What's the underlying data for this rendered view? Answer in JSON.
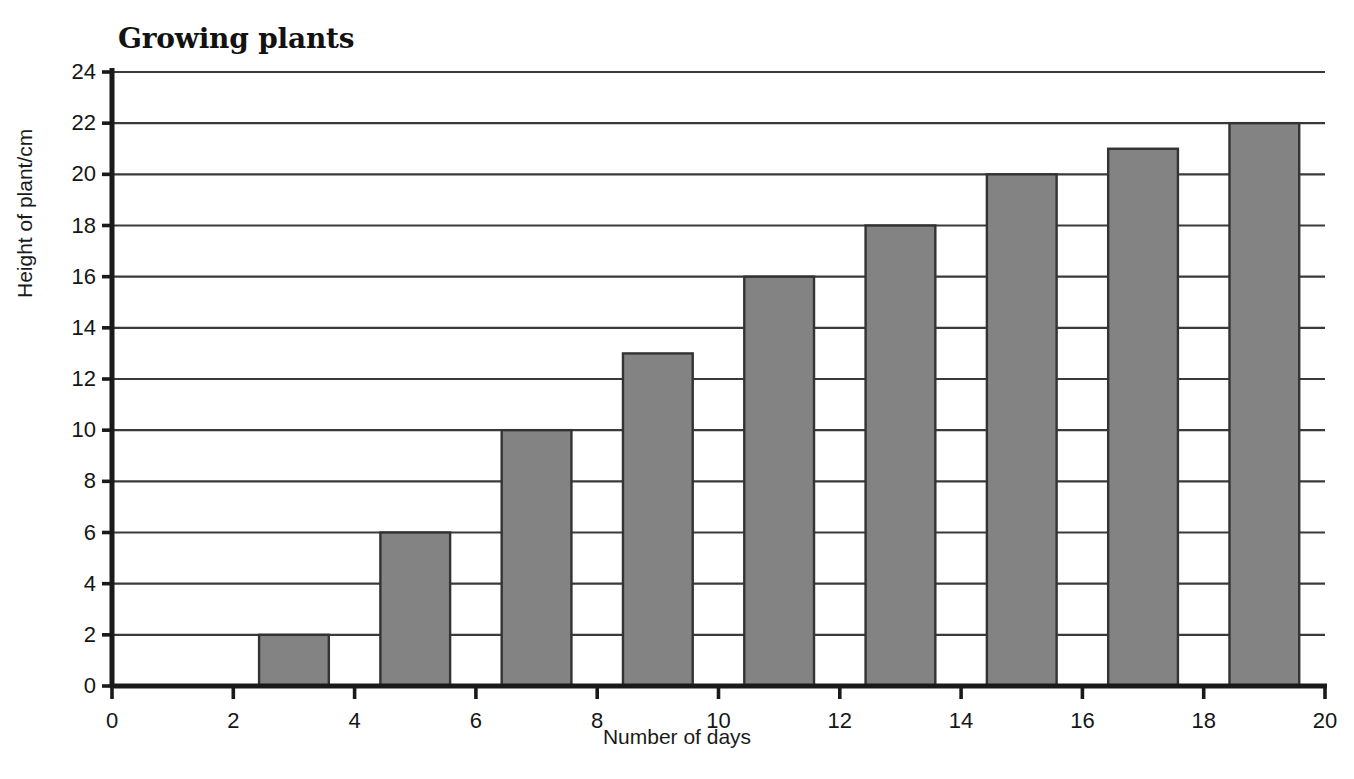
{
  "chart_data": {
    "type": "bar",
    "title": "Growing plants",
    "xlabel": "Number of days",
    "ylabel": "Height of plant/cm",
    "categories": [
      4,
      6,
      8,
      10,
      12,
      14,
      16,
      18,
      20
    ],
    "values": [
      2,
      6,
      10,
      13,
      16,
      18,
      20,
      21,
      22
    ],
    "x": [
      4,
      6,
      8,
      10,
      12,
      14,
      16,
      18,
      20
    ],
    "xlim": [
      0,
      20
    ],
    "ylim": [
      0,
      24
    ],
    "x_ticks": [
      0,
      2,
      4,
      6,
      8,
      10,
      12,
      14,
      16,
      18,
      20
    ],
    "y_ticks": [
      0,
      2,
      4,
      6,
      8,
      10,
      12,
      14,
      16,
      18,
      20,
      22,
      24
    ],
    "x_tick_labels": [
      "0",
      "2",
      "4",
      "6",
      "8",
      "10",
      "12",
      "14",
      "16",
      "18",
      "20"
    ],
    "y_tick_labels": [
      "0",
      "2",
      "4",
      "6",
      "8",
      "10",
      "12",
      "14",
      "16",
      "18",
      "20",
      "22",
      "24"
    ],
    "grid": "horizontal",
    "legend": "none",
    "bar_fill_color": "#838383",
    "bar_edge_color": "#333333",
    "axis_color": "#1a1a1a",
    "grid_color": "#3a3a3a",
    "background_color": "#ffffff",
    "bar_width_days": 1.15,
    "bar_align": "centered-on-odd-days"
  }
}
